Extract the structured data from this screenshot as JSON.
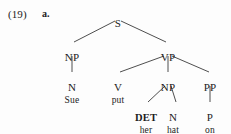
{
  "example": {
    "number_label": "(19)",
    "item_label": "a."
  },
  "colors": {
    "background": "#fdfdfd",
    "text": "#1c1c1c",
    "line": "#3a3a3a"
  },
  "tree": {
    "sentence": "Sue put her hat on",
    "nodes": [
      {
        "id": "S",
        "label": "S",
        "x": 118,
        "y": 18,
        "kind": "category"
      },
      {
        "id": "NP1",
        "label": "NP",
        "x": 72,
        "y": 52,
        "kind": "category"
      },
      {
        "id": "VP",
        "label": "VP",
        "x": 168,
        "y": 52,
        "kind": "category"
      },
      {
        "id": "N1",
        "label": "N",
        "x": 72,
        "y": 82,
        "kind": "category"
      },
      {
        "id": "V",
        "label": "V",
        "x": 118,
        "y": 82,
        "kind": "category"
      },
      {
        "id": "NP2",
        "label": "NP",
        "x": 168,
        "y": 82,
        "kind": "category"
      },
      {
        "id": "PP",
        "label": "PP",
        "x": 210,
        "y": 82,
        "kind": "category"
      },
      {
        "id": "DET",
        "label": "DET",
        "x": 146,
        "y": 112,
        "kind": "category-bold"
      },
      {
        "id": "N2",
        "label": "N",
        "x": 173,
        "y": 112,
        "kind": "category"
      },
      {
        "id": "P",
        "label": "P",
        "x": 210,
        "y": 112,
        "kind": "category"
      },
      {
        "id": "w1",
        "label": "Sue",
        "x": 72,
        "y": 95,
        "kind": "word"
      },
      {
        "id": "w2",
        "label": "put",
        "x": 118,
        "y": 95,
        "kind": "word"
      },
      {
        "id": "w3",
        "label": "her",
        "x": 146,
        "y": 125,
        "kind": "word"
      },
      {
        "id": "w4",
        "label": "hat",
        "x": 173,
        "y": 125,
        "kind": "word"
      },
      {
        "id": "w5",
        "label": "on",
        "x": 210,
        "y": 125,
        "kind": "word"
      }
    ],
    "edges": [
      {
        "from": "S",
        "to": "NP1",
        "x1": 115,
        "y1": 21,
        "x2": 74,
        "y2": 42
      },
      {
        "from": "S",
        "to": "VP",
        "x1": 121,
        "y1": 21,
        "x2": 166,
        "y2": 42
      },
      {
        "from": "NP1",
        "to": "N1",
        "x1": 72,
        "y1": 56,
        "x2": 72,
        "y2": 72
      },
      {
        "from": "VP",
        "to": "V",
        "x1": 164,
        "y1": 56,
        "x2": 120,
        "y2": 72
      },
      {
        "from": "VP",
        "to": "NP2",
        "x1": 168,
        "y1": 56,
        "x2": 168,
        "y2": 72
      },
      {
        "from": "VP",
        "to": "PP",
        "x1": 172,
        "y1": 56,
        "x2": 209,
        "y2": 72
      },
      {
        "from": "NP2",
        "to": "DET",
        "x1": 165,
        "y1": 86,
        "x2": 148,
        "y2": 102
      },
      {
        "from": "NP2",
        "to": "N2",
        "x1": 171,
        "y1": 86,
        "x2": 176,
        "y2": 102
      },
      {
        "from": "PP",
        "to": "P",
        "x1": 210,
        "y1": 86,
        "x2": 210,
        "y2": 102
      }
    ]
  }
}
